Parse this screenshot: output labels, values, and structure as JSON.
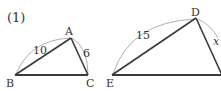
{
  "problem": {
    "number": "(1)"
  },
  "triangle_abc": {
    "vertices": {
      "A": "A",
      "B": "B",
      "C": "C"
    },
    "sides": {
      "AB": "10",
      "AC": "6"
    }
  },
  "triangle_def": {
    "vertices": {
      "D": "D",
      "E": "E"
    },
    "sides": {
      "ED": "15",
      "DF": "x"
    }
  },
  "colors": {
    "edge": "#3a3a3a",
    "arc": "#b0b0b0",
    "text": "#333333"
  }
}
